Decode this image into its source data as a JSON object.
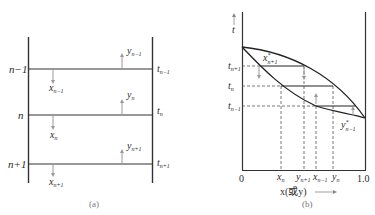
{
  "figure": {
    "panel_a": {
      "caption": "(a)",
      "stages": [
        {
          "label": "n−1",
          "liquid": {
            "base": "x",
            "sub": "n−1"
          },
          "vapor": {
            "base": "y",
            "sub": "n−1"
          },
          "temp": {
            "base": "t",
            "sub": "n−1"
          }
        },
        {
          "label": "n",
          "liquid": {
            "base": "x",
            "sub": "n"
          },
          "vapor": {
            "base": "y",
            "sub": "n"
          },
          "temp": {
            "base": "t",
            "sub": "n"
          }
        },
        {
          "label": "n+1",
          "liquid": {
            "base": "x",
            "sub": "n+1"
          },
          "vapor": {
            "base": "y",
            "sub": "n+1"
          },
          "temp": {
            "base": "t",
            "sub": "n+1"
          }
        }
      ]
    },
    "panel_b": {
      "caption": "(b)",
      "y_axis_label": "t",
      "x_axis_label": "x(或y)",
      "x_ticks": {
        "start": "0",
        "end": "1.0"
      },
      "temp_levels": [
        {
          "base": "t",
          "sub": "n+1"
        },
        {
          "base": "t",
          "sub": "n"
        },
        {
          "base": "t",
          "sub": "n−1"
        }
      ],
      "x_markers": [
        {
          "base": "x",
          "sub": "n"
        },
        {
          "base": "y",
          "sub": "n+1"
        },
        {
          "base": "x",
          "sub": "n−1"
        },
        {
          "base": "y",
          "sub": "n"
        }
      ],
      "curve_labels": [
        {
          "base": "x",
          "sup": "*",
          "sub": "n+1"
        },
        {
          "base": "y",
          "sup": "*",
          "sub": "n−1"
        }
      ]
    }
  }
}
